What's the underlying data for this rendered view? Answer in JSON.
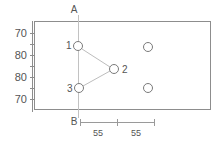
{
  "diagram": {
    "frame": {
      "x": 34,
      "y": 21,
      "width": 177,
      "height": 89
    },
    "reference_labels": {
      "top": "A",
      "bottom": "B"
    },
    "y_axis": {
      "ticks": [
        {
          "label": "70",
          "y": 33
        },
        {
          "label": "80",
          "y": 55
        },
        {
          "label": "80",
          "y": 77
        },
        {
          "label": "70",
          "y": 99
        }
      ],
      "line_x": 32,
      "line_top": 21,
      "line_bottom": 112
    },
    "nodes": [
      {
        "id": "1",
        "label": "1",
        "cx": 78,
        "cy": 46,
        "r": 4.5,
        "label_x": 67,
        "label_y": 43,
        "labeled": true
      },
      {
        "id": "2",
        "label": "2",
        "cx": 114,
        "cy": 69,
        "r": 4.5,
        "label_x": 123,
        "label_y": 73,
        "labeled": true
      },
      {
        "id": "3",
        "label": "3",
        "cx": 79,
        "cy": 88,
        "r": 4.5,
        "label_x": 68,
        "label_y": 92,
        "labeled": true
      },
      {
        "id": "4",
        "label": "",
        "cx": 148,
        "cy": 47,
        "r": 4.5,
        "label_x": 0,
        "label_y": 0,
        "labeled": false
      },
      {
        "id": "5",
        "label": "",
        "cx": 148,
        "cy": 88,
        "r": 4.5,
        "label_x": 0,
        "label_y": 0,
        "labeled": false
      }
    ],
    "connectors": [
      {
        "from": "1",
        "to": "2",
        "x1": 82,
        "y1": 49,
        "x2": 110,
        "y2": 67
      },
      {
        "from": "2",
        "to": "3",
        "x1": 110,
        "y1": 71,
        "x2": 83,
        "y2": 87
      }
    ],
    "centerline": {
      "x": 78,
      "y_top": 15,
      "y_bottom": 118,
      "top_label": "A",
      "top_label_x": 72,
      "top_label_y": 12,
      "bottom_label": "B",
      "bottom_label_x": 72,
      "bottom_label_y": 124
    },
    "dimension": {
      "y": 122,
      "x_start": 80,
      "x_mid": 117,
      "x_end": 155,
      "segments": [
        {
          "label": "55",
          "label_x": 98,
          "label_y": 135
        },
        {
          "label": "55",
          "label_x": 136,
          "label_y": 135
        }
      ]
    },
    "colors": {
      "frame_stroke": "#8d8d8d",
      "node_stroke": "#7a7a7a",
      "connector": "#bdbdbd",
      "guideline": "#c2c2c2",
      "text": "#555555",
      "background": "#ffffff"
    }
  }
}
